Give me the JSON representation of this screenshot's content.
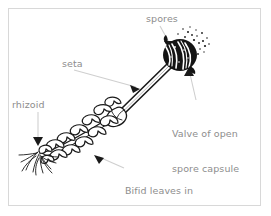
{
  "figure": {
    "background_color": "#ffffff",
    "border_color": "#d8d8d8",
    "ink_color": "#1a1a1a",
    "label_color": "#8d8d8d",
    "leader_color": "#cfcfcf"
  },
  "labels": {
    "spores": "spores",
    "seta": "seta",
    "rhizoid": "rhizoid",
    "valve_line1": "Valve of open",
    "valve_line2": "spore capsule",
    "bifid_line1": "Bifid leaves in",
    "bifid_line2": "three rows"
  },
  "parts": {
    "capsule": "spore-capsule",
    "spore_cloud": "spore-cloud",
    "seta_stalk": "seta-stalk",
    "leafy_stem": "leafy-stem",
    "bifid_leaves": "bifid-leaves",
    "rhizoids": "rhizoids"
  }
}
